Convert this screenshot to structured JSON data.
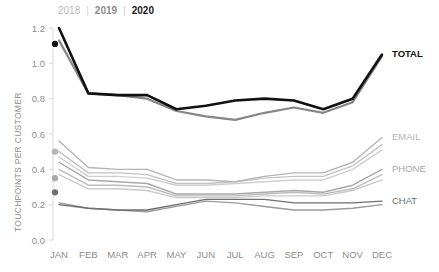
{
  "legend": {
    "items": [
      {
        "label": "2018",
        "color": "#b9b9b9"
      },
      {
        "label": "2019",
        "color": "#8c8c8c"
      },
      {
        "label": "2020",
        "color": "#1a1a1a"
      }
    ],
    "separator": "|"
  },
  "chart_data": {
    "type": "line",
    "title": "",
    "xlabel": "",
    "ylabel": "TOUCHPOINTS PER CUSTOMER",
    "ylim": [
      0.0,
      1.2
    ],
    "yticks": [
      0.0,
      0.2,
      0.4,
      0.6,
      0.8,
      1.0,
      1.2
    ],
    "ytick_labels": [
      "0.0",
      "0.2",
      "0.4",
      "0.6",
      "0.8",
      "1.0",
      "1.2"
    ],
    "grid": false,
    "legend_position": "top-left",
    "categories": [
      "JAN",
      "FEB",
      "MAR",
      "APR",
      "MAY",
      "JUN",
      "JUL",
      "AUG",
      "SEP",
      "OCT",
      "NOV",
      "DEC"
    ],
    "group_labels": [
      "TOTAL",
      "EMAIL",
      "PHONE",
      "CHAT"
    ],
    "series": [
      {
        "name": "TOTAL 2020",
        "group": "TOTAL",
        "year": "2020",
        "color": "#111111",
        "width": 2.6,
        "marker_first": true,
        "marker_value": 1.11,
        "values": [
          1.2,
          0.83,
          0.82,
          0.82,
          0.74,
          0.76,
          0.79,
          0.8,
          0.79,
          0.74,
          0.8,
          1.05
        ]
      },
      {
        "name": "TOTAL 2019",
        "group": "TOTAL",
        "year": "2019",
        "color": "#868686",
        "width": 2.2,
        "marker_first": false,
        "values": [
          1.13,
          0.83,
          0.82,
          0.8,
          0.73,
          0.7,
          0.68,
          0.72,
          0.75,
          0.72,
          0.78,
          1.04
        ]
      },
      {
        "name": "EMAIL 2020",
        "group": "EMAIL",
        "year": "2020",
        "color": "#b5b5b5",
        "width": 1.4,
        "marker_first": true,
        "marker_value": 0.5,
        "values": [
          0.56,
          0.41,
          0.4,
          0.4,
          0.34,
          0.34,
          0.33,
          0.36,
          0.38,
          0.38,
          0.44,
          0.58
        ]
      },
      {
        "name": "EMAIL 2019",
        "group": "EMAIL",
        "year": "2019",
        "color": "#c3c3c3",
        "width": 1.4,
        "marker_first": false,
        "values": [
          0.5,
          0.38,
          0.38,
          0.37,
          0.32,
          0.32,
          0.33,
          0.35,
          0.36,
          0.36,
          0.42,
          0.54
        ]
      },
      {
        "name": "EMAIL 2018",
        "group": "EMAIL",
        "year": "2018",
        "color": "#cfcfcf",
        "width": 1.4,
        "marker_first": false,
        "values": [
          0.47,
          0.36,
          0.36,
          0.35,
          0.31,
          0.31,
          0.32,
          0.33,
          0.34,
          0.34,
          0.4,
          0.51
        ]
      },
      {
        "name": "PHONE 2020",
        "group": "PHONE",
        "year": "2020",
        "color": "#a8a8a8",
        "width": 1.4,
        "marker_first": true,
        "marker_value": 0.35,
        "values": [
          0.44,
          0.34,
          0.33,
          0.32,
          0.26,
          0.26,
          0.26,
          0.27,
          0.28,
          0.27,
          0.31,
          0.4
        ]
      },
      {
        "name": "PHONE 2019",
        "group": "PHONE",
        "year": "2019",
        "color": "#bdbdbd",
        "width": 1.4,
        "marker_first": false,
        "values": [
          0.4,
          0.31,
          0.31,
          0.3,
          0.25,
          0.25,
          0.25,
          0.26,
          0.27,
          0.26,
          0.29,
          0.37
        ]
      },
      {
        "name": "PHONE 2018",
        "group": "PHONE",
        "year": "2018",
        "color": "#cacaca",
        "width": 1.4,
        "marker_first": false,
        "values": [
          0.37,
          0.29,
          0.29,
          0.28,
          0.24,
          0.24,
          0.24,
          0.25,
          0.25,
          0.25,
          0.28,
          0.34
        ]
      },
      {
        "name": "CHAT 2020",
        "group": "CHAT",
        "year": "2020",
        "color": "#6f6f6f",
        "width": 1.4,
        "marker_first": true,
        "marker_value": 0.27,
        "values": [
          0.2,
          0.18,
          0.17,
          0.17,
          0.2,
          0.23,
          0.23,
          0.23,
          0.21,
          0.21,
          0.21,
          0.22
        ]
      },
      {
        "name": "CHAT 2019",
        "group": "CHAT",
        "year": "2019",
        "color": "#9a9a9a",
        "width": 1.4,
        "marker_first": false,
        "values": [
          0.21,
          0.18,
          0.17,
          0.16,
          0.19,
          0.22,
          0.21,
          0.19,
          0.17,
          0.17,
          0.18,
          0.2
        ]
      }
    ],
    "series_labels": [
      {
        "text": "TOTAL",
        "color": "#111111",
        "bold": true,
        "value": 1.05
      },
      {
        "text": "EMAIL",
        "color": "#b5b5b5",
        "bold": false,
        "value": 0.58
      },
      {
        "text": "PHONE",
        "color": "#a8a8a8",
        "bold": false,
        "value": 0.4
      },
      {
        "text": "CHAT",
        "color": "#6f6f6f",
        "bold": false,
        "value": 0.22
      }
    ]
  }
}
